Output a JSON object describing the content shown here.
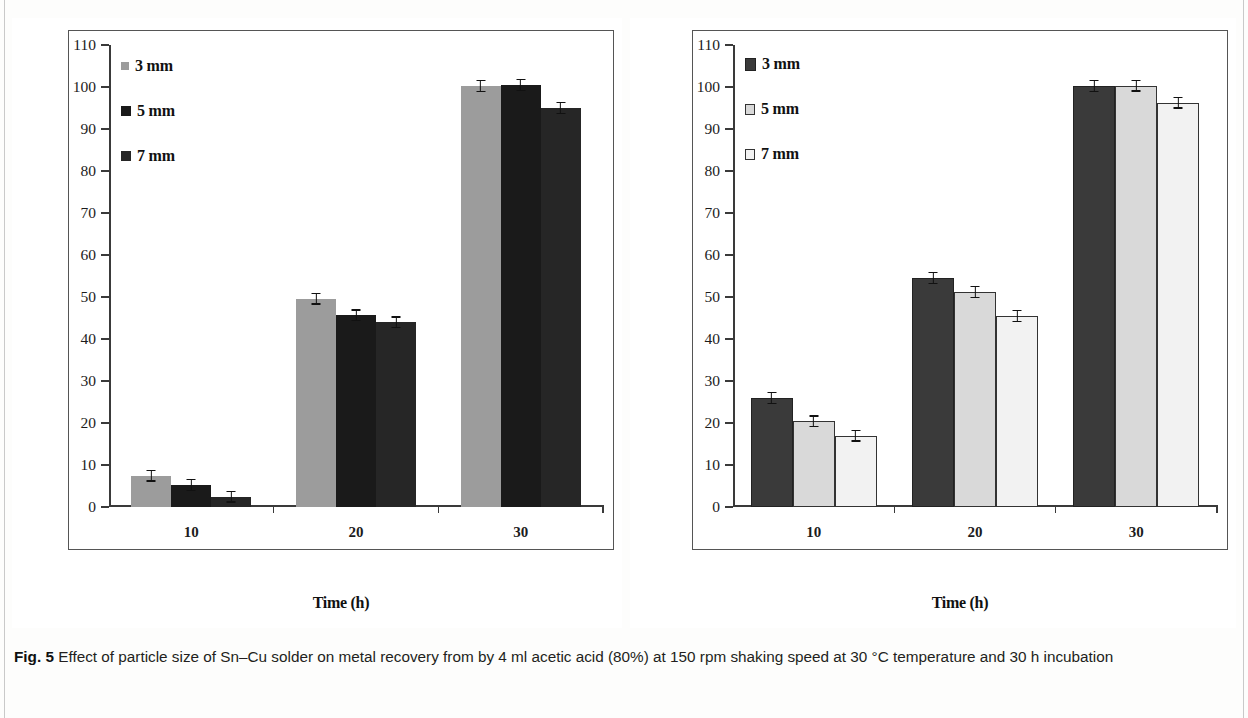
{
  "figure": {
    "number": "Fig. 5",
    "caption": "Effect of particle size of Sn–Cu solder on metal recovery from by 4 ml acetic acid (80%) at 150 rpm shaking speed at 30 °C temperature and 30 h incubation"
  },
  "chart_data": [
    {
      "type": "bar",
      "panel": "left",
      "title": "",
      "xlabel": "Time (h)",
      "ylabel": "Metal extraction (%)",
      "categories": [
        "10",
        "20",
        "30"
      ],
      "ylim": [
        0,
        110
      ],
      "yticks": [
        0,
        10,
        20,
        30,
        40,
        50,
        60,
        70,
        80,
        90,
        100,
        110
      ],
      "xticklabels": [
        "10",
        "20",
        "30"
      ],
      "grid": false,
      "legend_position": "top-left",
      "series": [
        {
          "name": "3 mm",
          "color": "#9c9c9c",
          "border": "#9c9c9c",
          "values": [
            7.5,
            49.6,
            100.2
          ],
          "errors": [
            0.5,
            0.7,
            0.3
          ]
        },
        {
          "name": "5 mm",
          "color": "#1a1a1a",
          "border": "#1a1a1a",
          "values": [
            5.2,
            45.6,
            100.5
          ],
          "errors": [
            0.4,
            0.5,
            0.3
          ]
        },
        {
          "name": "7 mm",
          "color": "#262626",
          "border": "#262626",
          "values": [
            2.5,
            44.0,
            95.0
          ],
          "errors": [
            0.5,
            0.5,
            0.5
          ]
        }
      ]
    },
    {
      "type": "bar",
      "panel": "right",
      "title": "",
      "xlabel": "Time (h)",
      "ylabel": "Metal extraction (%)",
      "categories": [
        "10",
        "20",
        "30"
      ],
      "ylim": [
        0,
        110
      ],
      "yticks": [
        0,
        10,
        20,
        30,
        40,
        50,
        60,
        70,
        80,
        90,
        100,
        110
      ],
      "xticklabels": [
        "10",
        "20",
        "30"
      ],
      "grid": false,
      "legend_position": "top-left",
      "series": [
        {
          "name": "3 mm",
          "color": "#3a3a3a",
          "border": "#222222",
          "values": [
            26.0,
            54.5,
            100.2
          ],
          "errors": [
            0.5,
            0.5,
            0.3
          ]
        },
        {
          "name": "5 mm",
          "color": "#d9d9d9",
          "border": "#333333",
          "values": [
            20.4,
            51.2,
            100.3
          ],
          "errors": [
            0.4,
            0.9,
            0.3
          ]
        },
        {
          "name": "7 mm",
          "color": "#f2f2f2",
          "border": "#333333",
          "values": [
            17.0,
            45.5,
            96.3
          ],
          "errors": [
            0.4,
            0.5,
            0.5
          ]
        }
      ]
    }
  ]
}
